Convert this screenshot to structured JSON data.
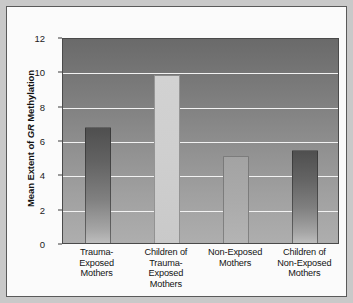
{
  "chart_data": {
    "type": "bar",
    "title": "",
    "xlabel": "",
    "ylabel": "Mean Extent of GR Methylation",
    "ylabel_prefix": "Mean Extent of ",
    "ylabel_italic": "GR",
    "ylabel_suffix": " Methylation",
    "ylim": [
      0,
      12
    ],
    "yticks": [
      0,
      2,
      4,
      6,
      8,
      10,
      12
    ],
    "ytick_labels": [
      "0",
      "2",
      "4",
      "6",
      "8",
      "10",
      "12"
    ],
    "grid": true,
    "legend": "none",
    "categories": [
      "Trauma-Exposed Mothers",
      "Children of Trauma-Exposed Mothers",
      "Non-Exposed Mothers",
      "Children of Non-Exposed Mothers"
    ],
    "category_lines": [
      [
        "Trauma-Exposed",
        "Mothers"
      ],
      [
        "Children of",
        "Trauma-",
        "Exposed",
        "Mothers"
      ],
      [
        "Non-Exposed",
        "Mothers"
      ],
      [
        "Children of",
        "Non-Exposed",
        "Mothers"
      ]
    ],
    "values": [
      6.75,
      9.8,
      5.05,
      5.4
    ],
    "bar_styles": [
      "dark",
      "light",
      "mid",
      "dark"
    ],
    "colors": {
      "bar_dark_top": "#4f4f4f",
      "bar_dark_bottom": "#bdbdbd",
      "bar_light": "#d2d2d2",
      "bar_mid": "#a9a9a9",
      "plot_bg_top": "#6a6a6a",
      "plot_bg_bottom": "#aeaeae",
      "gridline": "#f2f2f2",
      "frame_bg": "#fbfbfb",
      "page_bg": "#c9c9c9",
      "text": "#141414"
    }
  }
}
